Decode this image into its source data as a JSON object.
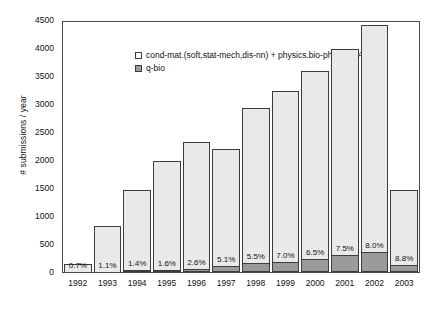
{
  "chart_data": {
    "type": "bar",
    "subtype": "stacked",
    "title": "",
    "xlabel": "",
    "ylabel": "# submissions / year",
    "ylim": [
      0,
      4500
    ],
    "yticks": [
      0,
      500,
      1000,
      1500,
      2000,
      2500,
      3000,
      3500,
      4000,
      4500
    ],
    "ytick_labels": [
      "0",
      "500",
      "1000",
      "1500",
      "2000",
      "2500",
      "3000",
      "3500",
      "4000",
      "4500"
    ],
    "grid": false,
    "legend_position": "upper left",
    "categories": [
      "1992",
      "1993",
      "1994",
      "1995",
      "1996",
      "1997",
      "1998",
      "1999",
      "2000",
      "2001",
      "2002",
      "2003"
    ],
    "series": [
      {
        "name": "cond-mat.(soft,stat-mech,dis-nn) + physics.bio-ph + nlin.AO",
        "color": "#e9e9e9",
        "values": [
          149,
          811,
          1440,
          1968,
          2279,
          2097,
          2788,
          3071,
          3385,
          3709,
          4094,
          1350
        ]
      },
      {
        "name": "q-bio",
        "color": "#9b9b9b",
        "values": [
          1,
          9,
          20,
          32,
          61,
          113,
          162,
          179,
          235,
          301,
          356,
          130
        ]
      }
    ],
    "totals": [
      150,
      820,
      1460,
      2000,
      2340,
      2210,
      2950,
      3250,
      3620,
      4010,
      4450,
      1480
    ],
    "annotations": [
      "0.7%",
      "1.1%",
      "1.4%",
      "1.6%",
      "2.6%",
      "5.1%",
      "5.5%",
      "7.0%",
      "6.5%",
      "7.5%",
      "8.0%",
      "8.8%"
    ],
    "annotation_note": "percentage of q-bio relative to bar total, drawn inside each bar near the baseline"
  },
  "legend": {
    "entries": [
      {
        "label": "cond-mat.(soft,stat-mech,dis-nn) + physics.bio-ph + nlin.AO",
        "swatch": "light"
      },
      {
        "label": "q-bio",
        "swatch": "dark"
      }
    ]
  },
  "colors": {
    "light_fill": "#e9e9e9",
    "dark_fill": "#9b9b9b",
    "outline": "#3c3c3c",
    "axis": "#4a4a4a",
    "background": "#ffffff",
    "text": "#111111"
  }
}
